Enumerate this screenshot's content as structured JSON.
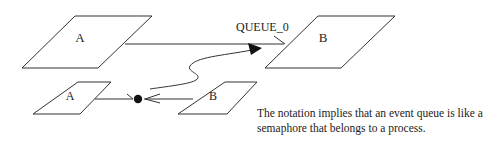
{
  "diagram": {
    "processes": [
      {
        "id": "big-a",
        "label": "A"
      },
      {
        "id": "big-b",
        "label": "B"
      },
      {
        "id": "small-a",
        "label": "A"
      },
      {
        "id": "small-b",
        "label": "B"
      }
    ],
    "queue_label": "QUEUE_0",
    "caption": "The notation implies that an event queue is like a semaphore that belongs to a process."
  }
}
